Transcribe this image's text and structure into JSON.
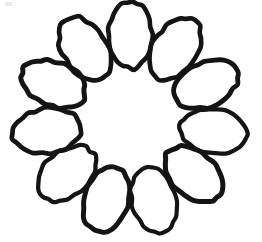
{
  "document": {
    "title": "Rosette Loop Drawing",
    "kind": "line-drawing",
    "description": "Hand-drawn spirograph-style rosette of overlapping oval loops arranged in a ring"
  },
  "canvas": {
    "width": 262,
    "height": 242,
    "background_color": "#ffffff"
  },
  "figure": {
    "name": "rosette",
    "center_x": 130,
    "center_y": 119,
    "outer_radius": 118,
    "inner_radius": 60,
    "petal_count": 11,
    "petal_radius_x": 22,
    "petal_radius_y": 34,
    "petal_center_radius": 84,
    "stroke_color": "#141414",
    "stroke_width": 4.6,
    "fill": "none",
    "start_angle_deg": -90
  },
  "artifacts": {
    "corner_smudge": {
      "name": "scan-smudge",
      "x": 5,
      "y": 2,
      "width": 7,
      "height": 4,
      "color": "#d9d9d9"
    }
  }
}
